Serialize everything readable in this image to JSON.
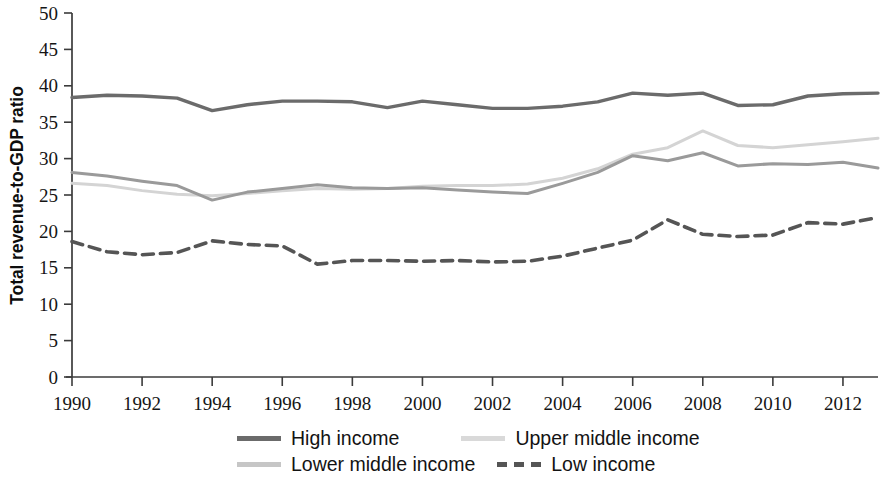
{
  "chart_data": {
    "type": "line",
    "title": "",
    "xlabel": "",
    "ylabel": "Total revenue-to-GDP ratio",
    "xlim": [
      1990,
      2013
    ],
    "ylim": [
      0,
      50
    ],
    "grid": false,
    "legend_position": "bottom",
    "x": [
      1990,
      1991,
      1992,
      1993,
      1994,
      1995,
      1996,
      1997,
      1998,
      1999,
      2000,
      2001,
      2002,
      2003,
      2004,
      2005,
      2006,
      2007,
      2008,
      2009,
      2010,
      2011,
      2012,
      2013
    ],
    "x_tick_labels": [
      "1990",
      "1992",
      "1994",
      "1996",
      "1998",
      "2000",
      "2002",
      "2004",
      "2006",
      "2008",
      "2010",
      "2012"
    ],
    "x_ticks": [
      1990,
      1992,
      1994,
      1996,
      1998,
      2000,
      2002,
      2004,
      2006,
      2008,
      2010,
      2012
    ],
    "y_ticks": [
      0,
      5,
      10,
      15,
      20,
      25,
      30,
      35,
      40,
      45,
      50
    ],
    "y_tick_labels": [
      "0",
      "5",
      "10",
      "15",
      "20",
      "25",
      "30",
      "35",
      "40",
      "45",
      "50"
    ],
    "series": [
      {
        "name": "High income",
        "color": "#6b6b6b",
        "style": "solid",
        "width": 3.4,
        "values": [
          38.4,
          38.7,
          38.6,
          38.2,
          37.9,
          37.8,
          36.6,
          37.2,
          37.8,
          37.8,
          37.8,
          37.2,
          36.9,
          37.3,
          37.8,
          36.9,
          37.1,
          37.4,
          38.1,
          38.2,
          38.9,
          38.5,
          39.0,
          37.3
        ],
        "values_by_year": {
          "1990": 38.4,
          "1991": 38.7,
          "1992": 38.6,
          "1993": 38.3,
          "1994": 36.6,
          "1995": 37.4,
          "1996": 37.9,
          "1997": 37.9,
          "1998": 37.8,
          "1999": 37.0,
          "2000": 37.9,
          "2001": 37.4,
          "2002": 36.9,
          "2003": 36.9,
          "2004": 37.2,
          "2005": 37.8,
          "2006": 39.0,
          "2007": 38.7,
          "2008": 39.0,
          "2009": 37.3,
          "2010": 37.4,
          "2011": 38.6,
          "2012": 38.9,
          "2013": 39.0
        }
      },
      {
        "name": "Upper middle income",
        "color": "#d4d4d4",
        "style": "solid",
        "width": 3.0,
        "values_by_year": {
          "1990": 26.6,
          "1991": 26.3,
          "1992": 25.6,
          "1993": 25.1,
          "1994": 24.9,
          "1995": 25.2,
          "1996": 25.6,
          "1997": 25.9,
          "1998": 25.8,
          "1999": 25.9,
          "2000": 26.2,
          "2001": 26.3,
          "2002": 26.3,
          "2003": 26.5,
          "2004": 27.3,
          "2005": 28.6,
          "2006": 30.6,
          "2007": 31.5,
          "2008": 33.8,
          "2009": 31.8,
          "2010": 31.5,
          "2011": 31.9,
          "2012": 32.3,
          "2013": 32.8
        }
      },
      {
        "name": "Lower middle income",
        "color": "#9a9a9a",
        "style": "solid",
        "width": 3.0,
        "values_by_year": {
          "1990": 28.1,
          "1991": 27.6,
          "1992": 26.9,
          "1993": 26.3,
          "1994": 24.3,
          "1995": 25.4,
          "1996": 25.9,
          "1997": 26.4,
          "1998": 26.0,
          "1999": 25.9,
          "2000": 26.0,
          "2001": 25.7,
          "2002": 25.4,
          "2003": 25.2,
          "2004": 26.6,
          "2005": 28.1,
          "2006": 30.4,
          "2007": 29.7,
          "2008": 30.8,
          "2009": 29.0,
          "2010": 29.3,
          "2011": 29.2,
          "2012": 29.5,
          "2013": 28.7
        }
      },
      {
        "name": "Low income",
        "color": "#555555",
        "style": "dashed",
        "width": 3.6,
        "values_by_year": {
          "1990": 18.6,
          "1991": 17.2,
          "1992": 16.8,
          "1993": 17.1,
          "1994": 18.7,
          "1995": 18.2,
          "1996": 18.0,
          "1997": 15.5,
          "1998": 16.0,
          "1999": 16.0,
          "2000": 15.9,
          "2001": 16.0,
          "2002": 15.8,
          "2003": 15.9,
          "2004": 16.6,
          "2005": 17.7,
          "2006": 18.8,
          "2007": 21.6,
          "2008": 19.6,
          "2009": 19.3,
          "2010": 19.5,
          "2011": 21.2,
          "2012": 21.0,
          "2013": 21.9
        }
      }
    ]
  },
  "legend": {
    "items": [
      {
        "label": "High income",
        "color": "#6b6b6b",
        "style": "solid"
      },
      {
        "label": "Upper middle income",
        "color": "#d9d9d9",
        "style": "solid"
      },
      {
        "label": "Lower middle income",
        "color": "#c6c6c6",
        "style": "solid"
      },
      {
        "label": "Low income",
        "color": "#555555",
        "style": "dashed"
      }
    ]
  }
}
